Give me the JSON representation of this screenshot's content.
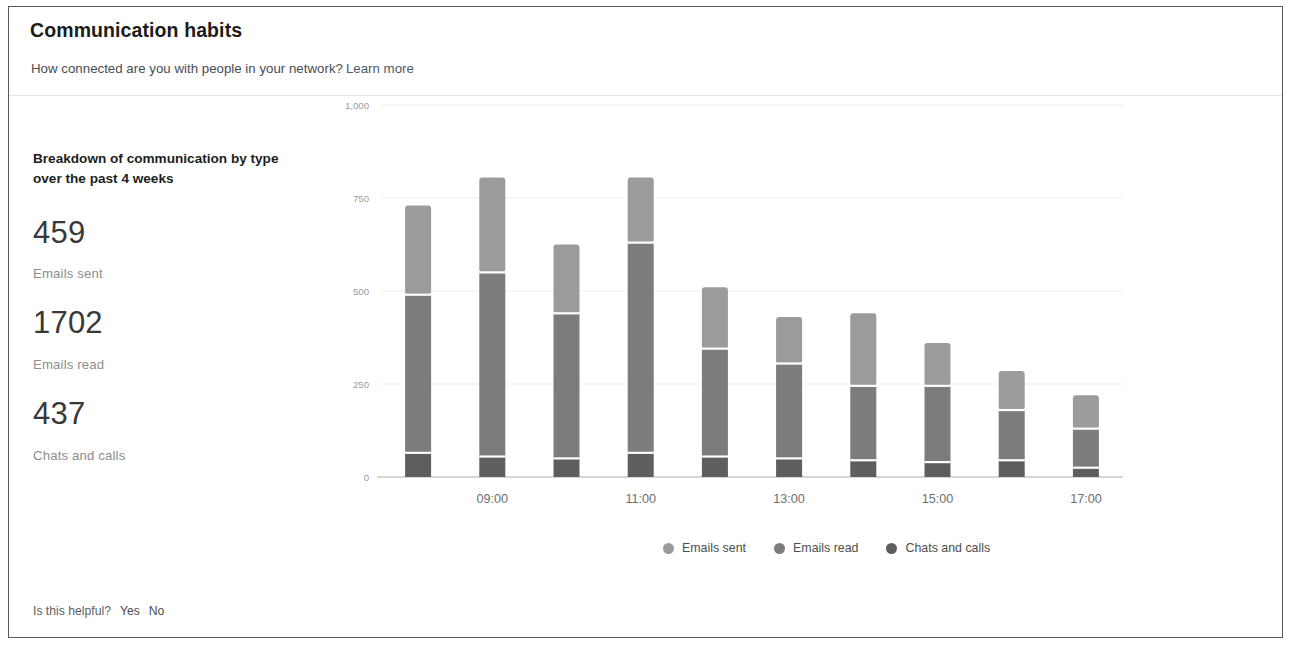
{
  "header": {
    "title": "Communication habits",
    "subtitle": "How connected are you with people in your network?",
    "learn_more": "Learn more"
  },
  "stats_panel": {
    "heading": "Breakdown of communication by type over the past 4 weeks",
    "stats": [
      {
        "value": "459",
        "label": "Emails sent"
      },
      {
        "value": "1702",
        "label": "Emails read"
      },
      {
        "value": "437",
        "label": "Chats and calls"
      }
    ]
  },
  "feedback": {
    "question": "Is this helpful?",
    "yes_label": "Yes",
    "no_label": "No"
  },
  "legend": [
    {
      "label": "Emails sent",
      "color": "#9b9b9b"
    },
    {
      "label": "Emails read",
      "color": "#7c7c7c"
    },
    {
      "label": "Chats and calls",
      "color": "#5e5e5e"
    }
  ],
  "chart_data": {
    "type": "bar",
    "stacked": true,
    "title": "Breakdown of communication by type over the past 4 weeks",
    "xlabel": "",
    "ylabel": "",
    "ylim": [
      0,
      1000
    ],
    "yticks": [
      0,
      250,
      500,
      750,
      1000
    ],
    "ytick_labels": [
      "0",
      "250",
      "500",
      "750",
      "1,000"
    ],
    "grid": true,
    "legend_position": "bottom",
    "x": [
      "08:00",
      "09:00",
      "10:00",
      "11:00",
      "12:00",
      "13:00",
      "14:00",
      "15:00",
      "16:00",
      "17:00"
    ],
    "xtick_labels": [
      "",
      "09:00",
      "",
      "11:00",
      "",
      "13:00",
      "",
      "15:00",
      "",
      "17:00"
    ],
    "categories": [
      "08:00",
      "09:00",
      "10:00",
      "11:00",
      "12:00",
      "13:00",
      "14:00",
      "15:00",
      "16:00",
      "17:00"
    ],
    "series": [
      {
        "name": "Chats and calls",
        "color": "#5e5e5e",
        "values": [
          65,
          55,
          50,
          65,
          55,
          50,
          45,
          40,
          45,
          25
        ]
      },
      {
        "name": "Emails read",
        "color": "#7c7c7c",
        "values": [
          425,
          495,
          390,
          565,
          290,
          255,
          200,
          205,
          135,
          105
        ]
      },
      {
        "name": "Emails sent",
        "color": "#9b9b9b",
        "values": [
          240,
          255,
          185,
          175,
          165,
          125,
          195,
          115,
          105,
          90
        ]
      }
    ],
    "totals": [
      730,
      805,
      625,
      805,
      510,
      430,
      440,
      360,
      285,
      220
    ]
  }
}
